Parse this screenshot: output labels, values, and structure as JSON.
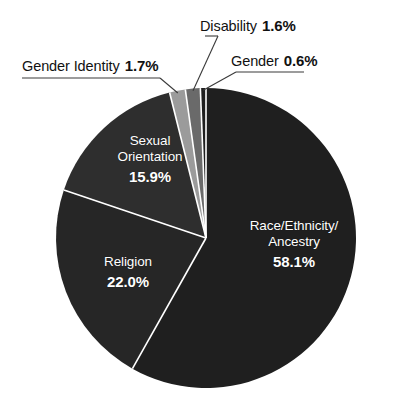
{
  "chart_data": {
    "type": "pie",
    "title": "",
    "subtitle": "",
    "xlabel": "",
    "ylabel": "",
    "legend_position": "none",
    "grid": false,
    "label_format": "name + percent",
    "total_percent": 99.9,
    "categories": [
      "Race/Ethnicity/Ancestry",
      "Religion",
      "Sexual Orientation",
      "Gender Identity",
      "Disability",
      "Gender"
    ],
    "values": [
      58.1,
      22.0,
      15.9,
      1.7,
      1.6,
      0.6
    ],
    "slices": [
      {
        "name": "Race/Ethnicity/Ancestry",
        "name_line1": "Race/Ethnicity/",
        "name_line2": "Ancestry",
        "percent": 58.1,
        "percent_label": "58.1%",
        "color": "#1f1f1f",
        "label_placement": "inside",
        "label_color": "#ffffff"
      },
      {
        "name": "Religion",
        "percent": 22.0,
        "percent_label": "22.0%",
        "color": "#262626",
        "label_placement": "inside",
        "label_color": "#ffffff"
      },
      {
        "name": "Sexual Orientation",
        "name_line1": "Sexual",
        "name_line2": "Orientation",
        "percent": 15.9,
        "percent_label": "15.9%",
        "color": "#2e2e2e",
        "label_placement": "inside",
        "label_color": "#ffffff"
      },
      {
        "name": "Gender Identity",
        "percent": 1.7,
        "percent_label": "1.7%",
        "color": "#9b9b9b",
        "label_placement": "outside",
        "label_color": "#111111"
      },
      {
        "name": "Disability",
        "percent": 1.6,
        "percent_label": "1.6%",
        "color": "#6a6a6a",
        "label_placement": "outside",
        "label_color": "#111111"
      },
      {
        "name": "Gender",
        "percent": 0.6,
        "percent_label": "0.6%",
        "color": "#1f1f1f",
        "label_placement": "outside",
        "label_color": "#111111"
      }
    ],
    "geometry": {
      "center_x": 206,
      "center_y": 238,
      "radius": 150,
      "start_angle_deg": -90,
      "direction": "clockwise"
    },
    "colors": {
      "background": "#ffffff",
      "slice_divider": "#ffffff",
      "outside_text": "#111111",
      "inside_text": "#ffffff",
      "leader_line": "#3a3a3a"
    }
  }
}
